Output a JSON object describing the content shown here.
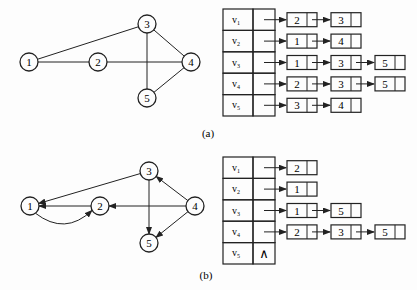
{
  "figure_a": {
    "caption": "(a)",
    "graph": {
      "type": "undirected",
      "nodes": [
        {
          "id": "1",
          "x": 29,
          "y": 62
        },
        {
          "id": "2",
          "x": 98,
          "y": 62
        },
        {
          "id": "3",
          "x": 147,
          "y": 24
        },
        {
          "id": "4",
          "x": 191,
          "y": 62
        },
        {
          "id": "5",
          "x": 147,
          "y": 98
        }
      ],
      "edges": [
        [
          "1",
          "3"
        ],
        [
          "1",
          "2"
        ],
        [
          "2",
          "4"
        ],
        [
          "3",
          "4"
        ],
        [
          "3",
          "5"
        ],
        [
          "4",
          "5"
        ]
      ]
    },
    "adjacency_list": [
      {
        "vertex": "v",
        "sub": "1",
        "list": [
          "2",
          "3"
        ]
      },
      {
        "vertex": "v",
        "sub": "2",
        "list": [
          "1",
          "4"
        ]
      },
      {
        "vertex": "v",
        "sub": "3",
        "list": [
          "1",
          "3",
          "5"
        ]
      },
      {
        "vertex": "v",
        "sub": "4",
        "list": [
          "2",
          "3",
          "5"
        ]
      },
      {
        "vertex": "v",
        "sub": "5",
        "list": [
          "3",
          "4"
        ]
      }
    ]
  },
  "figure_b": {
    "caption": "(b)",
    "graph": {
      "type": "directed",
      "nodes": [
        {
          "id": "1",
          "x": 30,
          "y": 206
        },
        {
          "id": "2",
          "x": 100,
          "y": 206
        },
        {
          "id": "3",
          "x": 149,
          "y": 171
        },
        {
          "id": "4",
          "x": 195,
          "y": 206
        },
        {
          "id": "5",
          "x": 149,
          "y": 243
        }
      ],
      "edges": [
        [
          "3",
          "1"
        ],
        [
          "2",
          "1"
        ],
        [
          "1",
          "2"
        ],
        [
          "4",
          "2"
        ],
        [
          "4",
          "3"
        ],
        [
          "3",
          "5"
        ],
        [
          "4",
          "5"
        ]
      ]
    },
    "adjacency_list": [
      {
        "vertex": "v",
        "sub": "1",
        "list": [
          "2"
        ]
      },
      {
        "vertex": "v",
        "sub": "2",
        "list": [
          "1"
        ]
      },
      {
        "vertex": "v",
        "sub": "3",
        "list": [
          "1",
          "5"
        ]
      },
      {
        "vertex": "v",
        "sub": "4",
        "list": [
          "2",
          "3",
          "5"
        ]
      },
      {
        "vertex": "v",
        "sub": "5",
        "list": [],
        "null_symbol": "∧"
      }
    ]
  },
  "colors": {
    "line": "#222222",
    "background": "#fdfdfd"
  }
}
